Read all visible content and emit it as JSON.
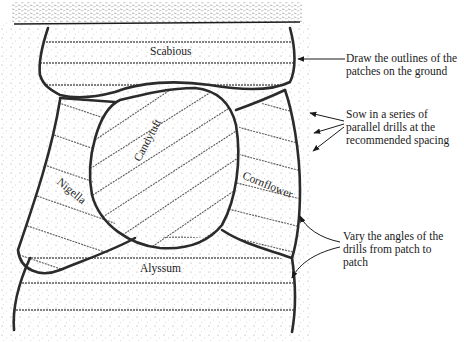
{
  "diagram": {
    "title": "",
    "patches": [
      {
        "id": "scabious",
        "label": "Scabious",
        "rotation": 0
      },
      {
        "id": "candytuft",
        "label": "Candytuft",
        "rotation": -62
      },
      {
        "id": "nigella",
        "label": "Nigella",
        "rotation": 40
      },
      {
        "id": "cornflower",
        "label": "Cornflower",
        "rotation": 22
      },
      {
        "id": "alyssum",
        "label": "Alyssum",
        "rotation": 0
      }
    ],
    "annotations": [
      {
        "id": "outlines",
        "text": "Draw the outlines of the\npatches on the ground"
      },
      {
        "id": "drills",
        "text": "Sow in a series of\nparallel drills at the\nrecommended spacing"
      },
      {
        "id": "angles",
        "text": "Vary the angles of the\ndrills from patch to\npatch"
      }
    ],
    "colors": {
      "outline": "#2b2b2b",
      "drill": "#555555",
      "stipple": "#8a8a8a",
      "background": "#ffffff"
    }
  }
}
